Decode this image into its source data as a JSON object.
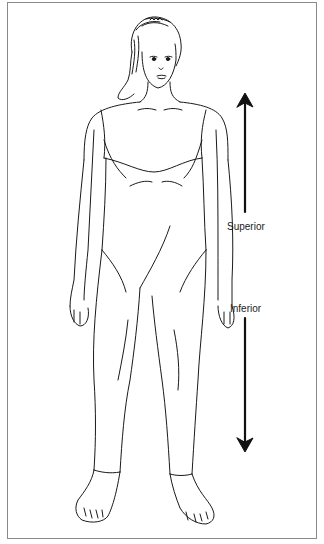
{
  "diagram": {
    "labels": {
      "superior": "Superior",
      "inferior": "Inferior"
    },
    "arrows": [
      {
        "direction": "up",
        "label": "Superior"
      },
      {
        "direction": "down",
        "label": "Inferior"
      }
    ],
    "colors": {
      "line": "#1a1a1a",
      "frame": "#8a8a8a",
      "background": "#ffffff"
    }
  }
}
